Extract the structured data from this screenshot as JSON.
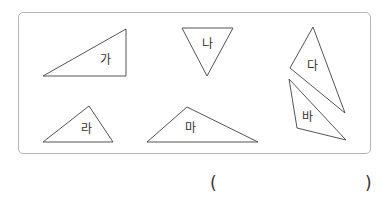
{
  "diagram": {
    "frame": {
      "x": 18,
      "y": 12,
      "width": 353,
      "height": 142,
      "border_color": "#b5b5b5"
    },
    "triangles": [
      {
        "label": "가",
        "points": "43,76 126,29 126,76",
        "label_pos": [
          105,
          60
        ]
      },
      {
        "label": "나",
        "points": "182,28 233,28 207,76",
        "label_pos": [
          207,
          44
        ]
      },
      {
        "label": "다",
        "points": "313,27 290,68 345,113",
        "label_pos": [
          312,
          66
        ]
      },
      {
        "label": "라",
        "points": "43,142 89,106 113,142",
        "label_pos": [
          86,
          129
        ]
      },
      {
        "label": "마",
        "points": "147,142 187,107 258,142",
        "label_pos": [
          190,
          128
        ]
      },
      {
        "label": "바",
        "points": "289,79 297,128 346,140",
        "label_pos": [
          307,
          117
        ]
      }
    ],
    "stroke_color": "#555555"
  },
  "answer": {
    "open_paren": "(",
    "close_paren": ")",
    "value": ""
  }
}
